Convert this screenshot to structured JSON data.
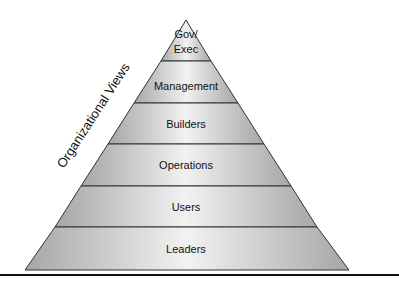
{
  "diagram": {
    "type": "pyramid",
    "side_label": "Organizational Views",
    "layers_top_to_bottom": [
      {
        "label_line1": "Gov/",
        "label_line2": "Exec"
      },
      {
        "label_line1": "Management"
      },
      {
        "label_line1": "Builders"
      },
      {
        "label_line1": "Operations"
      },
      {
        "label_line1": "Users"
      },
      {
        "label_line1": "Leaders"
      }
    ],
    "colors": {
      "fill_edge": "#a6a6a6",
      "fill_center": "#f2f2f2",
      "outline": "#333333",
      "rule": "#111111"
    }
  }
}
